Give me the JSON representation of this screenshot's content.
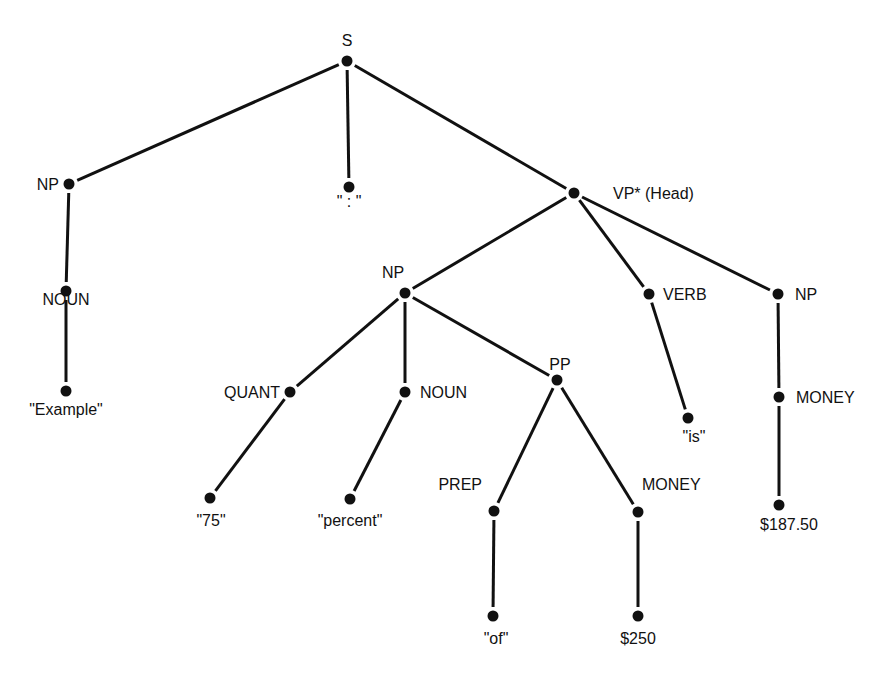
{
  "diagram": {
    "type": "parse-tree",
    "colors": {
      "ink": "#111111",
      "background": "#ffffff"
    },
    "nodes": [
      {
        "id": "S",
        "label": "S",
        "x": 347,
        "y": 61,
        "lx": 347,
        "ly": 46,
        "anchor": "middle"
      },
      {
        "id": "NP1",
        "label": "NP",
        "x": 69,
        "y": 184,
        "lx": 59,
        "ly": 190,
        "anchor": "end"
      },
      {
        "id": "COLON",
        "label": "\" : \"",
        "x": 349,
        "y": 187,
        "lx": 349,
        "ly": 207,
        "anchor": "middle"
      },
      {
        "id": "VP",
        "label": "VP* (Head)",
        "x": 574,
        "y": 193,
        "lx": 613,
        "ly": 199,
        "anchor": "start"
      },
      {
        "id": "NOUN1",
        "label": "NOUN",
        "x": 66,
        "y": 291,
        "lx": 66,
        "ly": 305,
        "anchor": "middle"
      },
      {
        "id": "EXAMPLE",
        "label": "\"Example\"",
        "x": 66,
        "y": 391,
        "lx": 66,
        "ly": 415,
        "anchor": "middle"
      },
      {
        "id": "NP2",
        "label": "NP",
        "x": 405,
        "y": 293,
        "lx": 393,
        "ly": 278,
        "anchor": "middle"
      },
      {
        "id": "VERB",
        "label": "VERB",
        "x": 649,
        "y": 294,
        "lx": 663,
        "ly": 300,
        "anchor": "start"
      },
      {
        "id": "NP3",
        "label": "NP",
        "x": 778,
        "y": 294,
        "lx": 795,
        "ly": 300,
        "anchor": "start"
      },
      {
        "id": "QUANT",
        "label": "QUANT",
        "x": 290,
        "y": 392,
        "lx": 280,
        "ly": 398,
        "anchor": "end"
      },
      {
        "id": "NOUN2",
        "label": "NOUN",
        "x": 405,
        "y": 392,
        "lx": 420,
        "ly": 398,
        "anchor": "start"
      },
      {
        "id": "PP",
        "label": "PP",
        "x": 557,
        "y": 380,
        "lx": 560,
        "ly": 370,
        "anchor": "middle"
      },
      {
        "id": "IS",
        "label": "\"is\"",
        "x": 688,
        "y": 418,
        "lx": 694,
        "ly": 442,
        "anchor": "middle"
      },
      {
        "id": "MONEY1",
        "label": "MONEY",
        "x": 779,
        "y": 397,
        "lx": 796,
        "ly": 403,
        "anchor": "start"
      },
      {
        "id": "N75",
        "label": "\"75\"",
        "x": 210,
        "y": 498,
        "lx": 211,
        "ly": 526,
        "anchor": "middle"
      },
      {
        "id": "PERCENT",
        "label": "\"percent\"",
        "x": 350,
        "y": 499,
        "lx": 350,
        "ly": 526,
        "anchor": "middle"
      },
      {
        "id": "PREP",
        "label": "PREP",
        "x": 494,
        "y": 511,
        "lx": 482,
        "ly": 490,
        "anchor": "end"
      },
      {
        "id": "MONEY2",
        "label": "MONEY",
        "x": 638,
        "y": 512,
        "lx": 642,
        "ly": 490,
        "anchor": "start"
      },
      {
        "id": "P18750",
        "label": "$187.50",
        "x": 779,
        "y": 505,
        "lx": 789,
        "ly": 530,
        "anchor": "middle"
      },
      {
        "id": "OF",
        "label": "\"of\"",
        "x": 493,
        "y": 616,
        "lx": 496,
        "ly": 644,
        "anchor": "middle"
      },
      {
        "id": "P250",
        "label": "$250",
        "x": 638,
        "y": 616,
        "lx": 638,
        "ly": 644,
        "anchor": "middle"
      }
    ],
    "edges": [
      [
        "S",
        "NP1"
      ],
      [
        "S",
        "COLON"
      ],
      [
        "S",
        "VP"
      ],
      [
        "NP1",
        "NOUN1"
      ],
      [
        "NOUN1",
        "EXAMPLE"
      ],
      [
        "VP",
        "NP2"
      ],
      [
        "VP",
        "VERB"
      ],
      [
        "VP",
        "NP3"
      ],
      [
        "NP2",
        "QUANT"
      ],
      [
        "NP2",
        "NOUN2"
      ],
      [
        "NP2",
        "PP"
      ],
      [
        "VERB",
        "IS"
      ],
      [
        "NP3",
        "MONEY1"
      ],
      [
        "MONEY1",
        "P18750"
      ],
      [
        "QUANT",
        "N75"
      ],
      [
        "NOUN2",
        "PERCENT"
      ],
      [
        "PP",
        "PREP"
      ],
      [
        "PP",
        "MONEY2"
      ],
      [
        "PREP",
        "OF"
      ],
      [
        "MONEY2",
        "P250"
      ]
    ]
  }
}
